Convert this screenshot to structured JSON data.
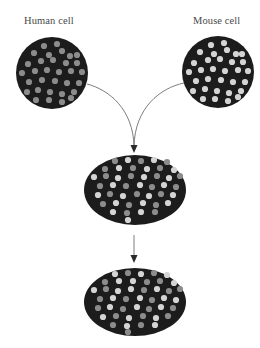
{
  "diagram": {
    "labels": {
      "human": "Human cell",
      "mouse": "Mouse cell"
    },
    "colors": {
      "cell_fill": "#1c1c1c",
      "human_marker": "#8c8c8c",
      "mouse_marker": "#d4d4d4",
      "connector": "#6e6e6e",
      "label_text": "#4a4a4a"
    },
    "cells": [
      {
        "id": "human-cell",
        "shape": "circle",
        "cx": 52,
        "cy": 73,
        "r": 36,
        "dots": [
          {
            "x": 44,
            "y": 46,
            "t": "h"
          },
          {
            "x": 57,
            "y": 44,
            "t": "h"
          },
          {
            "x": 34,
            "y": 53,
            "t": "h"
          },
          {
            "x": 49,
            "y": 55,
            "t": "h"
          },
          {
            "x": 62,
            "y": 51,
            "t": "h"
          },
          {
            "x": 70,
            "y": 56,
            "t": "h"
          },
          {
            "x": 77,
            "y": 55,
            "t": "h"
          },
          {
            "x": 28,
            "y": 64,
            "t": "h"
          },
          {
            "x": 41,
            "y": 61,
            "t": "h"
          },
          {
            "x": 53,
            "y": 60,
            "t": "h"
          },
          {
            "x": 66,
            "y": 63,
            "t": "h"
          },
          {
            "x": 77,
            "y": 63,
            "t": "h"
          },
          {
            "x": 22,
            "y": 73,
            "t": "h"
          },
          {
            "x": 35,
            "y": 71,
            "t": "h"
          },
          {
            "x": 47,
            "y": 70,
            "t": "h"
          },
          {
            "x": 59,
            "y": 72,
            "t": "h"
          },
          {
            "x": 71,
            "y": 71,
            "t": "h"
          },
          {
            "x": 82,
            "y": 72,
            "t": "h"
          },
          {
            "x": 29,
            "y": 82,
            "t": "h"
          },
          {
            "x": 42,
            "y": 80,
            "t": "h"
          },
          {
            "x": 55,
            "y": 81,
            "t": "h"
          },
          {
            "x": 67,
            "y": 83,
            "t": "h"
          },
          {
            "x": 79,
            "y": 83,
            "t": "h"
          },
          {
            "x": 27,
            "y": 92,
            "t": "h"
          },
          {
            "x": 38,
            "y": 90,
            "t": "h"
          },
          {
            "x": 50,
            "y": 92,
            "t": "h"
          },
          {
            "x": 62,
            "y": 94,
            "t": "h"
          },
          {
            "x": 74,
            "y": 92,
            "t": "h"
          },
          {
            "x": 36,
            "y": 100,
            "t": "h"
          },
          {
            "x": 49,
            "y": 100,
            "t": "h"
          },
          {
            "x": 62,
            "y": 102,
            "t": "h"
          },
          {
            "x": 71,
            "y": 98,
            "t": "h"
          }
        ]
      },
      {
        "id": "mouse-cell",
        "shape": "circle",
        "cx": 218,
        "cy": 72,
        "r": 36,
        "dots": [
          {
            "x": 211,
            "y": 45,
            "t": "m"
          },
          {
            "x": 224,
            "y": 43,
            "t": "m"
          },
          {
            "x": 200,
            "y": 52,
            "t": "m"
          },
          {
            "x": 214,
            "y": 54,
            "t": "m"
          },
          {
            "x": 227,
            "y": 50,
            "t": "m"
          },
          {
            "x": 236,
            "y": 54,
            "t": "m"
          },
          {
            "x": 242,
            "y": 54,
            "t": "m"
          },
          {
            "x": 194,
            "y": 63,
            "t": "m"
          },
          {
            "x": 208,
            "y": 60,
            "t": "m"
          },
          {
            "x": 220,
            "y": 59,
            "t": "m"
          },
          {
            "x": 232,
            "y": 62,
            "t": "m"
          },
          {
            "x": 243,
            "y": 62,
            "t": "m"
          },
          {
            "x": 189,
            "y": 72,
            "t": "m"
          },
          {
            "x": 201,
            "y": 70,
            "t": "m"
          },
          {
            "x": 213,
            "y": 69,
            "t": "m"
          },
          {
            "x": 225,
            "y": 71,
            "t": "m"
          },
          {
            "x": 238,
            "y": 70,
            "t": "m"
          },
          {
            "x": 248,
            "y": 71,
            "t": "m"
          },
          {
            "x": 196,
            "y": 81,
            "t": "m"
          },
          {
            "x": 208,
            "y": 79,
            "t": "m"
          },
          {
            "x": 221,
            "y": 80,
            "t": "m"
          },
          {
            "x": 233,
            "y": 82,
            "t": "m"
          },
          {
            "x": 245,
            "y": 82,
            "t": "m"
          },
          {
            "x": 193,
            "y": 91,
            "t": "m"
          },
          {
            "x": 205,
            "y": 89,
            "t": "m"
          },
          {
            "x": 217,
            "y": 91,
            "t": "m"
          },
          {
            "x": 229,
            "y": 93,
            "t": "m"
          },
          {
            "x": 241,
            "y": 91,
            "t": "m"
          },
          {
            "x": 203,
            "y": 99,
            "t": "m"
          },
          {
            "x": 215,
            "y": 99,
            "t": "m"
          },
          {
            "x": 228,
            "y": 101,
            "t": "m"
          },
          {
            "x": 238,
            "y": 97,
            "t": "m"
          }
        ]
      },
      {
        "id": "hybrid-cell-early",
        "shape": "ellipse",
        "cx": 135,
        "cy": 190,
        "rx": 51,
        "ry": 35,
        "dots": [
          {
            "x": 115,
            "y": 161,
            "t": "h"
          },
          {
            "x": 128,
            "y": 160,
            "t": "m"
          },
          {
            "x": 141,
            "y": 161,
            "t": "h"
          },
          {
            "x": 154,
            "y": 160,
            "t": "m"
          },
          {
            "x": 167,
            "y": 162,
            "t": "h"
          },
          {
            "x": 105,
            "y": 169,
            "t": "h"
          },
          {
            "x": 119,
            "y": 168,
            "t": "m"
          },
          {
            "x": 133,
            "y": 168,
            "t": "h"
          },
          {
            "x": 147,
            "y": 169,
            "t": "m"
          },
          {
            "x": 160,
            "y": 168,
            "t": "h"
          },
          {
            "x": 174,
            "y": 170,
            "t": "m"
          },
          {
            "x": 94,
            "y": 177,
            "t": "m"
          },
          {
            "x": 106,
            "y": 176,
            "t": "h"
          },
          {
            "x": 118,
            "y": 178,
            "t": "m"
          },
          {
            "x": 131,
            "y": 176,
            "t": "h"
          },
          {
            "x": 144,
            "y": 177,
            "t": "m"
          },
          {
            "x": 157,
            "y": 176,
            "t": "h"
          },
          {
            "x": 169,
            "y": 178,
            "t": "m"
          },
          {
            "x": 180,
            "y": 176,
            "t": "h"
          },
          {
            "x": 100,
            "y": 186,
            "t": "h"
          },
          {
            "x": 113,
            "y": 185,
            "t": "m"
          },
          {
            "x": 126,
            "y": 186,
            "t": "h"
          },
          {
            "x": 140,
            "y": 185,
            "t": "m"
          },
          {
            "x": 152,
            "y": 187,
            "t": "h"
          },
          {
            "x": 164,
            "y": 185,
            "t": "m"
          },
          {
            "x": 176,
            "y": 187,
            "t": "h"
          },
          {
            "x": 98,
            "y": 195,
            "t": "m"
          },
          {
            "x": 110,
            "y": 194,
            "t": "h"
          },
          {
            "x": 123,
            "y": 196,
            "t": "m"
          },
          {
            "x": 137,
            "y": 194,
            "t": "h"
          },
          {
            "x": 149,
            "y": 196,
            "t": "m"
          },
          {
            "x": 161,
            "y": 194,
            "t": "h"
          },
          {
            "x": 173,
            "y": 195,
            "t": "m"
          },
          {
            "x": 103,
            "y": 204,
            "t": "h"
          },
          {
            "x": 116,
            "y": 203,
            "t": "m"
          },
          {
            "x": 129,
            "y": 205,
            "t": "h"
          },
          {
            "x": 143,
            "y": 203,
            "t": "m"
          },
          {
            "x": 156,
            "y": 205,
            "t": "h"
          },
          {
            "x": 168,
            "y": 203,
            "t": "m"
          },
          {
            "x": 113,
            "y": 212,
            "t": "m"
          },
          {
            "x": 127,
            "y": 213,
            "t": "h"
          },
          {
            "x": 141,
            "y": 212,
            "t": "m"
          },
          {
            "x": 155,
            "y": 212,
            "t": "h"
          },
          {
            "x": 128,
            "y": 220,
            "t": "m"
          }
        ]
      },
      {
        "id": "hybrid-cell-mixed",
        "shape": "ellipse",
        "cx": 135,
        "cy": 302,
        "rx": 51,
        "ry": 34,
        "dots": [
          {
            "x": 115,
            "y": 274,
            "t": "m"
          },
          {
            "x": 128,
            "y": 273,
            "t": "h"
          },
          {
            "x": 141,
            "y": 274,
            "t": "m"
          },
          {
            "x": 154,
            "y": 273,
            "t": "h"
          },
          {
            "x": 167,
            "y": 275,
            "t": "m"
          },
          {
            "x": 105,
            "y": 282,
            "t": "h"
          },
          {
            "x": 119,
            "y": 281,
            "t": "m"
          },
          {
            "x": 133,
            "y": 281,
            "t": "m"
          },
          {
            "x": 147,
            "y": 282,
            "t": "h"
          },
          {
            "x": 160,
            "y": 281,
            "t": "h"
          },
          {
            "x": 174,
            "y": 283,
            "t": "m"
          },
          {
            "x": 94,
            "y": 290,
            "t": "m"
          },
          {
            "x": 106,
            "y": 289,
            "t": "h"
          },
          {
            "x": 118,
            "y": 291,
            "t": "m"
          },
          {
            "x": 131,
            "y": 289,
            "t": "m"
          },
          {
            "x": 144,
            "y": 290,
            "t": "h"
          },
          {
            "x": 157,
            "y": 289,
            "t": "m"
          },
          {
            "x": 169,
            "y": 291,
            "t": "h"
          },
          {
            "x": 180,
            "y": 289,
            "t": "h"
          },
          {
            "x": 100,
            "y": 299,
            "t": "h"
          },
          {
            "x": 113,
            "y": 298,
            "t": "m"
          },
          {
            "x": 126,
            "y": 299,
            "t": "h"
          },
          {
            "x": 140,
            "y": 298,
            "t": "m"
          },
          {
            "x": 152,
            "y": 300,
            "t": "h"
          },
          {
            "x": 164,
            "y": 298,
            "t": "m"
          },
          {
            "x": 176,
            "y": 300,
            "t": "m"
          },
          {
            "x": 98,
            "y": 308,
            "t": "h"
          },
          {
            "x": 110,
            "y": 307,
            "t": "m"
          },
          {
            "x": 123,
            "y": 309,
            "t": "h"
          },
          {
            "x": 137,
            "y": 307,
            "t": "m"
          },
          {
            "x": 149,
            "y": 309,
            "t": "h"
          },
          {
            "x": 161,
            "y": 307,
            "t": "m"
          },
          {
            "x": 173,
            "y": 308,
            "t": "h"
          },
          {
            "x": 103,
            "y": 317,
            "t": "m"
          },
          {
            "x": 116,
            "y": 316,
            "t": "h"
          },
          {
            "x": 129,
            "y": 318,
            "t": "m"
          },
          {
            "x": 143,
            "y": 316,
            "t": "h"
          },
          {
            "x": 156,
            "y": 318,
            "t": "m"
          },
          {
            "x": 168,
            "y": 316,
            "t": "h"
          },
          {
            "x": 113,
            "y": 325,
            "t": "h"
          },
          {
            "x": 127,
            "y": 326,
            "t": "m"
          },
          {
            "x": 141,
            "y": 325,
            "t": "h"
          },
          {
            "x": 155,
            "y": 325,
            "t": "m"
          },
          {
            "x": 128,
            "y": 332,
            "t": "h"
          }
        ]
      }
    ],
    "connectors": [
      {
        "id": "human-to-hybrid-curve",
        "d": "M 87 84 C 110 90, 133 110, 134 146"
      },
      {
        "id": "mouse-to-hybrid-curve",
        "d": "M 184 83 C 160 88, 135 108, 134 146"
      },
      {
        "id": "hybrid-to-mixed-line",
        "d": "M 134 235 L 134 256"
      }
    ],
    "arrowheads": [
      {
        "id": "fusion-arrowhead",
        "points": "130.5,145 137.5,145 134,153"
      },
      {
        "id": "division-arrowhead",
        "points": "130.5,255 137.5,255 134,263"
      }
    ],
    "dot_radius": 3.1
  }
}
